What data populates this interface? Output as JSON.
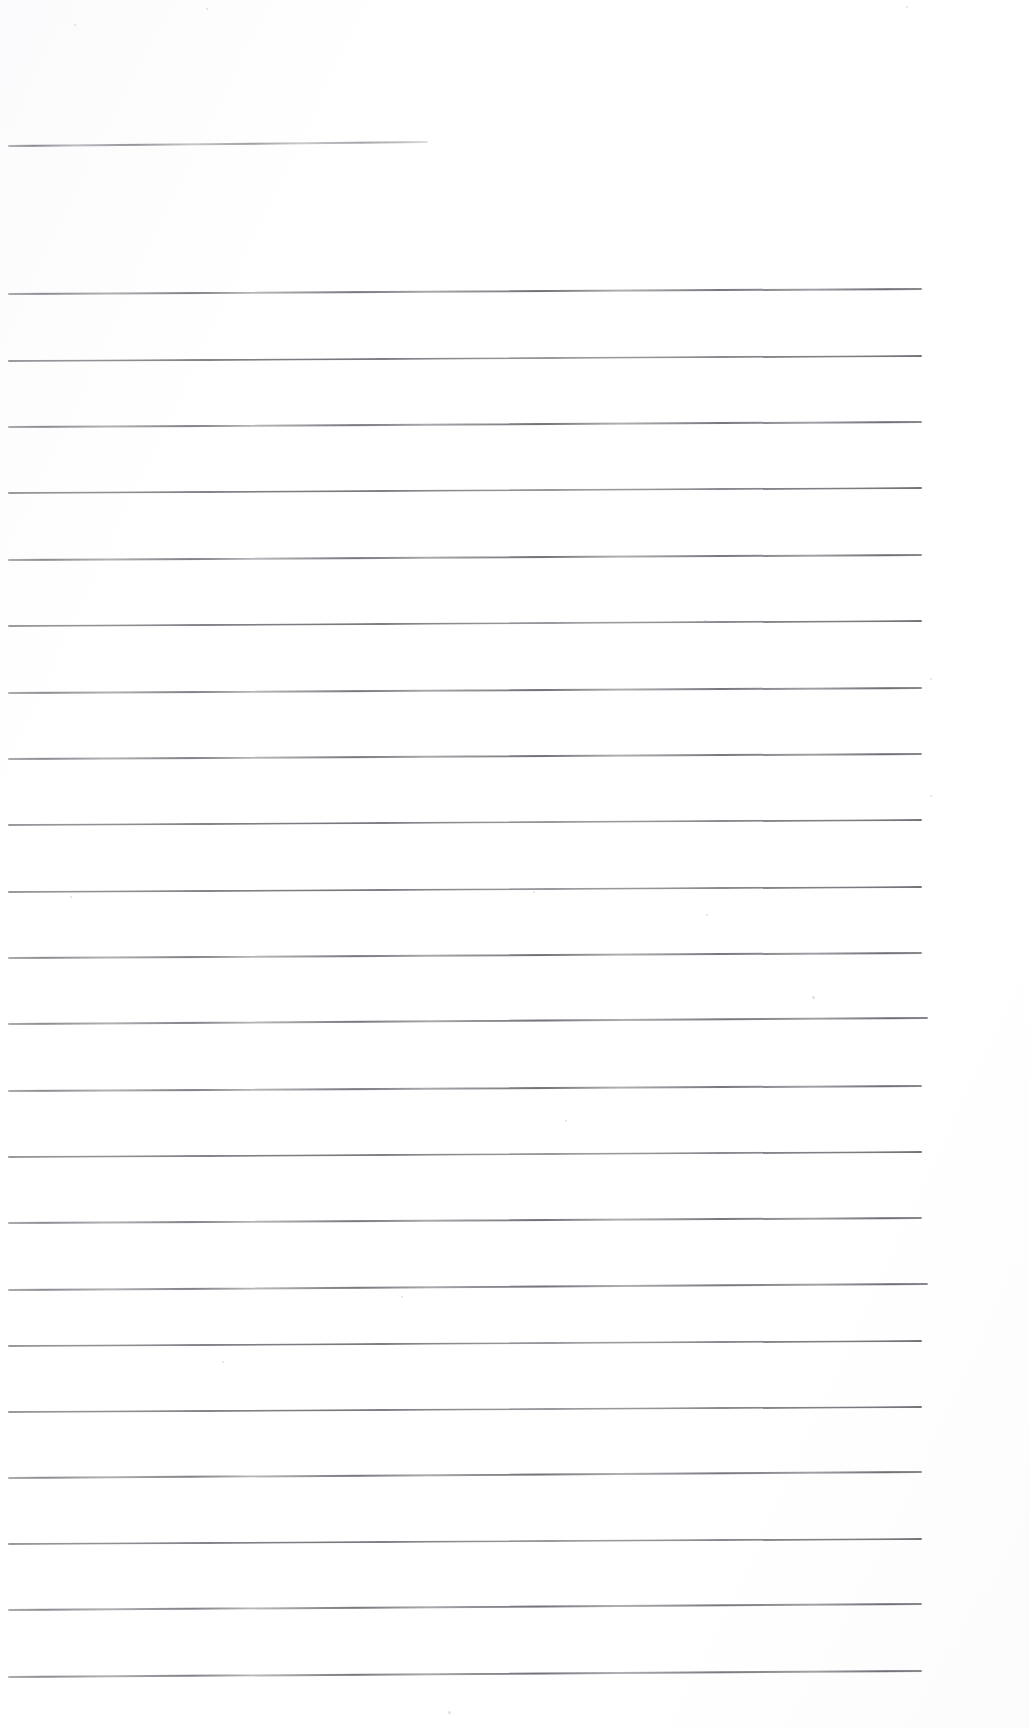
{
  "document": {
    "kind": "scanned-blank-ruled-paper",
    "title": "Blank Ruled Paper Scan",
    "page_width": 1029,
    "page_height": 1728,
    "background_color": "#ffffff",
    "paper_tint": "#fdfdfe",
    "rule_color": "#6a6c72",
    "rule_color_light": "#8a8c92",
    "visible_text": "",
    "handwriting_present": "none",
    "printed_text_present": "none"
  },
  "ruling": {
    "left_margin_x": 8,
    "right_edge_x": 922,
    "line_thickness_px": 1,
    "average_spacing_px": 66.5,
    "total_lines": 22,
    "slope_note": "lines rise slightly toward the right (scan skew ~0.2 deg)",
    "header_rule": {
      "index": 0,
      "y_left": 145,
      "y_right": 141,
      "x_start": 8,
      "x_end": 428,
      "style": "short",
      "label": "header-rule"
    },
    "body_rules": [
      {
        "index": 1,
        "y_left": 293,
        "y_right": 288,
        "x_start": 8,
        "x_end": 922,
        "style": "ink"
      },
      {
        "index": 2,
        "y_left": 360,
        "y_right": 355,
        "x_start": 8,
        "x_end": 922,
        "style": "stipple"
      },
      {
        "index": 3,
        "y_left": 426,
        "y_right": 421,
        "x_start": 8,
        "x_end": 922,
        "style": "ink"
      },
      {
        "index": 4,
        "y_left": 492,
        "y_right": 487,
        "x_start": 8,
        "x_end": 922,
        "style": "stipple"
      },
      {
        "index": 5,
        "y_left": 559,
        "y_right": 554,
        "x_start": 8,
        "x_end": 922,
        "style": "ink"
      },
      {
        "index": 6,
        "y_left": 625,
        "y_right": 620,
        "x_start": 8,
        "x_end": 922,
        "style": "stipple"
      },
      {
        "index": 7,
        "y_left": 692,
        "y_right": 687,
        "x_start": 8,
        "x_end": 922,
        "style": "ink"
      },
      {
        "index": 8,
        "y_left": 758,
        "y_right": 753,
        "x_start": 8,
        "x_end": 922,
        "style": "ink"
      },
      {
        "index": 9,
        "y_left": 824,
        "y_right": 819,
        "x_start": 8,
        "x_end": 922,
        "style": "stipple"
      },
      {
        "index": 10,
        "y_left": 891,
        "y_right": 886,
        "x_start": 8,
        "x_end": 922,
        "style": "stipple"
      },
      {
        "index": 11,
        "y_left": 957,
        "y_right": 952,
        "x_start": 8,
        "x_end": 922,
        "style": "ink"
      },
      {
        "index": 12,
        "y_left": 1023,
        "y_right": 1017,
        "x_start": 8,
        "x_end": 928,
        "style": "ink"
      },
      {
        "index": 13,
        "y_left": 1090,
        "y_right": 1085,
        "x_start": 8,
        "x_end": 922,
        "style": "ink"
      },
      {
        "index": 14,
        "y_left": 1156,
        "y_right": 1151,
        "x_start": 8,
        "x_end": 922,
        "style": "stipple"
      },
      {
        "index": 15,
        "y_left": 1222,
        "y_right": 1217,
        "x_start": 8,
        "x_end": 922,
        "style": "ink"
      },
      {
        "index": 16,
        "y_left": 1289,
        "y_right": 1283,
        "x_start": 8,
        "x_end": 928,
        "style": "ink"
      },
      {
        "index": 17,
        "y_left": 1345,
        "y_right": 1340,
        "x_start": 8,
        "x_end": 922,
        "style": "stipple"
      },
      {
        "index": 18,
        "y_left": 1411,
        "y_right": 1406,
        "x_start": 8,
        "x_end": 922,
        "style": "stipple"
      },
      {
        "index": 19,
        "y_left": 1477,
        "y_right": 1471,
        "x_start": 8,
        "x_end": 922,
        "style": "ink"
      },
      {
        "index": 20,
        "y_left": 1543,
        "y_right": 1538,
        "x_start": 8,
        "x_end": 922,
        "style": "stipple"
      },
      {
        "index": 21,
        "y_left": 1609,
        "y_right": 1603,
        "x_start": 8,
        "x_end": 922,
        "style": "ink"
      },
      {
        "index": 22,
        "y_left": 1676,
        "y_right": 1670,
        "x_start": 8,
        "x_end": 922,
        "style": "ink"
      }
    ]
  },
  "artifacts": {
    "label": "faint scanner specks and dust",
    "specks": [
      {
        "x": 704,
        "y": 620,
        "size": 3
      },
      {
        "x": 930,
        "y": 678,
        "size": 2
      },
      {
        "x": 930,
        "y": 795,
        "size": 2
      },
      {
        "x": 70,
        "y": 896,
        "size": 2
      },
      {
        "x": 533,
        "y": 891,
        "size": 2
      },
      {
        "x": 706,
        "y": 914,
        "size": 2
      },
      {
        "x": 812,
        "y": 996,
        "size": 3
      },
      {
        "x": 565,
        "y": 1120,
        "size": 2
      },
      {
        "x": 401,
        "y": 1296,
        "size": 2
      },
      {
        "x": 222,
        "y": 1361,
        "size": 2
      },
      {
        "x": 448,
        "y": 1711,
        "size": 3
      },
      {
        "x": 74,
        "y": 24,
        "size": 2
      },
      {
        "x": 206,
        "y": 8,
        "size": 2
      },
      {
        "x": 906,
        "y": 6,
        "size": 2
      }
    ]
  }
}
